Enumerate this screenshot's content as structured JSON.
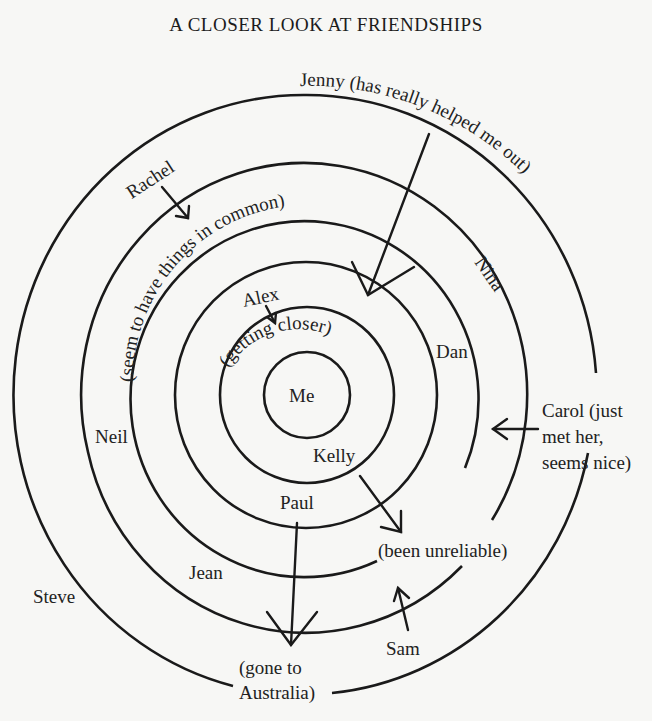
{
  "title": "A CLOSER LOOK AT FRIENDSHIPS",
  "diagram": {
    "type": "concentric-circles",
    "center_label": "Me",
    "rings": [
      {
        "level": 1,
        "labels": [
          "Me"
        ]
      },
      {
        "level": 2,
        "labels": [
          "(getting closer)",
          "Kelly"
        ]
      },
      {
        "level": 3,
        "labels": [
          "Alex",
          "Paul"
        ]
      },
      {
        "level": 4,
        "labels": [
          "Dan",
          "(seem to have things in common)"
        ]
      },
      {
        "level": 5,
        "labels": [
          "Rachel",
          "Nina",
          "Neil",
          "Jean"
        ]
      },
      {
        "level": 6,
        "labels": [
          "Jenny (has really helped me out)",
          "Steve",
          "Sam"
        ]
      }
    ],
    "labels": {
      "me": "Me",
      "getting_closer": "(getting closer)",
      "alex": "Alex",
      "kelly": "Kelly",
      "paul": "Paul",
      "dan": "Dan",
      "seem_common": "(seem to have things in common)",
      "rachel": "Rachel",
      "nina": "Nina",
      "neil": "Neil",
      "jean": "Jean",
      "jenny": "Jenny (has really helped me out)",
      "steve": "Steve",
      "sam": "Sam",
      "carol_1": "Carol (just",
      "carol_2": "met her,",
      "carol_3": "seems nice)",
      "unreliable": "(been unreliable)",
      "gone_1": "(gone to",
      "gone_2": "Australia)"
    },
    "arrows": [
      {
        "from": "Rachel",
        "direction": "inward"
      },
      {
        "from": "Alex",
        "direction": "inward"
      },
      {
        "from": "Jenny",
        "direction": "inward"
      },
      {
        "from": "Nina",
        "direction": "inward"
      },
      {
        "from": "Carol",
        "direction": "inward"
      },
      {
        "from": "Kelly",
        "direction": "outward",
        "to": "(been unreliable)"
      },
      {
        "from": "Paul",
        "direction": "outward",
        "to": "(gone to Australia)"
      },
      {
        "from": "Sam",
        "direction": "inward",
        "to": "(been unreliable)"
      }
    ]
  }
}
